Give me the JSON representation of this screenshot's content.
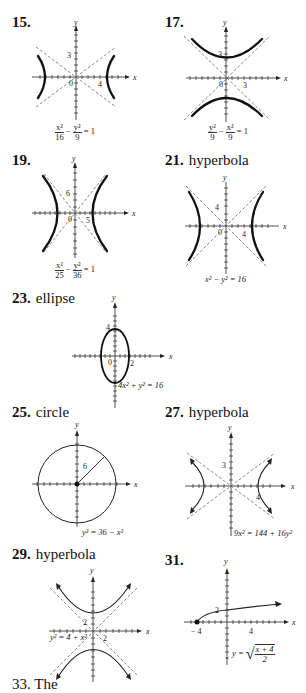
{
  "problems": [
    {
      "number": "15.",
      "kind": "",
      "equation": {
        "numerator1": "x²",
        "denominator1": "16",
        "op": "−",
        "numerator2": "y²",
        "denominator2": "9",
        "rhs": "= 1"
      },
      "ticks": {
        "x_label": "4",
        "y_label": "3",
        "origin": "0"
      }
    },
    {
      "number": "17.",
      "kind": "",
      "equation": {
        "numerator1": "y²",
        "denominator1": "9",
        "op": "−",
        "numerator2": "x²",
        "denominator2": "9",
        "rhs": "= 1"
      },
      "ticks": {
        "x_label": "3",
        "y_label": "3",
        "origin": "0"
      }
    },
    {
      "number": "19.",
      "kind": "",
      "equation": {
        "numerator1": "x²",
        "denominator1": "25",
        "op": "−",
        "numerator2": "y²",
        "denominator2": "36",
        "rhs": "= 1"
      },
      "ticks": {
        "x_label": "5",
        "y_label": "6",
        "origin": "0"
      }
    },
    {
      "number": "21.",
      "kind": "hyperbola",
      "equation": {
        "text": "x² − y² = 16"
      },
      "ticks": {
        "x_label": "4",
        "y_label": "4",
        "origin": "0"
      }
    },
    {
      "number": "23.",
      "kind": "ellipse",
      "equation": {
        "text": "4x² + y² = 16"
      },
      "ticks": {
        "x_label": "2",
        "y_label": "4",
        "origin": "0"
      }
    },
    {
      "number": "25.",
      "kind": "circle",
      "equation": {
        "text": "y² = 36 − x²"
      },
      "ticks": {
        "radius_label": "6"
      }
    },
    {
      "number": "27.",
      "kind": "hyperbola",
      "equation": {
        "text": "9x² = 144 + 16y²"
      },
      "ticks": {
        "x_label": "4",
        "y_label": "3"
      }
    },
    {
      "number": "29.",
      "kind": "hyperbola",
      "equation": {
        "text": "y² = 4 + x²"
      },
      "ticks": {
        "x_label": "2",
        "y_label": "2"
      }
    },
    {
      "number": "31.",
      "kind": "",
      "equation": {
        "lhs": "y =",
        "numerator": "x + 4",
        "denominator": "2"
      },
      "ticks": {
        "x_neg_label": "− 4",
        "x_label": "4",
        "y_label": "2"
      }
    }
  ],
  "axis_labels": {
    "x": "x",
    "y": "y"
  },
  "truncated_next": "33. The"
}
